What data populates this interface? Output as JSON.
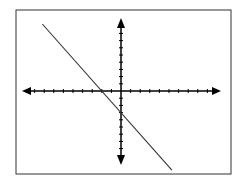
{
  "chart_data": {
    "type": "line",
    "title": "",
    "xlabel": "",
    "ylabel": "",
    "grid": false,
    "legend": null,
    "x_ticks_each_side": 10,
    "y_ticks_each_side": 9,
    "xlim": [
      -10,
      10
    ],
    "ylim": [
      -10,
      10
    ],
    "series": [
      {
        "name": "line",
        "equation": "y = -1.5x - 3",
        "x_intercept": -2,
        "y_intercept": -3,
        "x": [
          -8.2,
          5.3
        ],
        "y": [
          9.3,
          -11
        ]
      }
    ]
  },
  "colors": {
    "axis": "#000000",
    "line": "#333333",
    "frame": "#333333",
    "background": "#ffffff"
  }
}
